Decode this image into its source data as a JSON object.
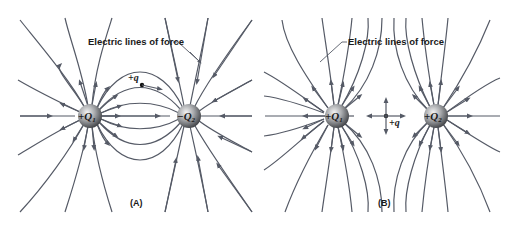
{
  "panels": [
    {
      "id": "A",
      "caption": "(A)",
      "annotation": "Electric lines of force",
      "charges": [
        {
          "label": "+Q",
          "subscript": "1",
          "sign": "positive"
        },
        {
          "label": "−Q",
          "subscript": "2",
          "sign": "negative"
        }
      ],
      "test_charge": {
        "label": "+q"
      }
    },
    {
      "id": "B",
      "caption": "(B)",
      "annotation": "Electric lines of force",
      "charges": [
        {
          "label": "+Q",
          "subscript": "1",
          "sign": "positive"
        },
        {
          "label": "+Q",
          "subscript": "2",
          "sign": "positive"
        }
      ],
      "test_charge": {
        "label": "+q"
      }
    }
  ],
  "colors": {
    "field_line": "#555a66",
    "charge_sphere": "#7a7d82",
    "text": "#1a1a1a"
  }
}
